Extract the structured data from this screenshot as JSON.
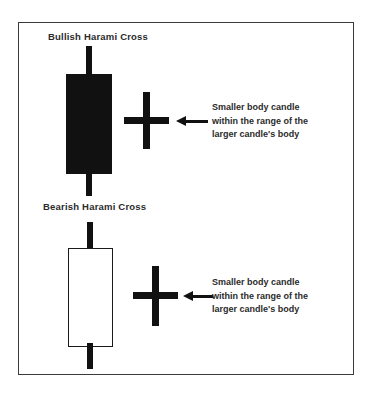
{
  "figure": {
    "background_color": "#ffffff",
    "frame_color": "#3a3a3a",
    "ink_color": "#111111",
    "text_color": "#2b2b2b"
  },
  "sections": [
    {
      "id": "bullish",
      "title": "Bullish Harami Cross",
      "large_candle": {
        "type": "filled-black-candle",
        "body_fill": "#111111",
        "has_upper_wick": true,
        "has_lower_wick": true
      },
      "small_candle": {
        "type": "doji-cross-candle",
        "color": "#111111"
      },
      "arrow": {
        "direction": "left",
        "color": "#111111"
      },
      "annotation": {
        "line1": "Smaller body candle",
        "line2": "within the range of the",
        "line3": "larger candle's body"
      }
    },
    {
      "id": "bearish",
      "title": "Bearish Harami Cross",
      "large_candle": {
        "type": "hollow-white-candle",
        "body_fill": "#ffffff",
        "body_outline": "#1a1a1a",
        "has_upper_wick": true,
        "has_lower_wick": true
      },
      "small_candle": {
        "type": "doji-cross-candle",
        "color": "#111111"
      },
      "arrow": {
        "direction": "left",
        "color": "#111111"
      },
      "annotation": {
        "line1": "Smaller body candle",
        "line2": "within the range of the",
        "line3": "larger candle's body"
      }
    }
  ]
}
